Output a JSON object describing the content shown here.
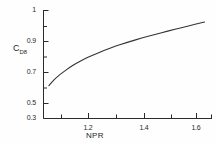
{
  "chart_data": {
    "type": "line",
    "title": "",
    "xlabel": "NPR",
    "ylabel": "C",
    "ylabel_subscript": "D8",
    "xlim": [
      1.03,
      1.72
    ],
    "ylim": [
      0.3,
      1.0
    ],
    "grid": false,
    "legend": null,
    "x_ticks_major": [
      1.2,
      1.4,
      1.6
    ],
    "x_tick_labels": [
      "1.2",
      "1.4",
      "1.6"
    ],
    "x_ticks_minor": [
      1.1,
      1.3,
      1.5,
      1.7
    ],
    "y_ticks_major": [
      0.3,
      0.5,
      0.7,
      0.9,
      1.0
    ],
    "y_tick_labels": [
      "0.3",
      "0.5",
      "0.7",
      "0.9",
      "1"
    ],
    "y_ticks_minor": [
      0.4,
      0.6,
      0.8,
      0.95
    ],
    "series": [
      {
        "name": "CD8 vs NPR",
        "x": [
          1.05,
          1.07,
          1.09,
          1.11,
          1.14,
          1.17,
          1.2,
          1.24,
          1.28,
          1.32,
          1.37,
          1.42,
          1.47,
          1.52,
          1.57,
          1.63
        ],
        "y": [
          0.513,
          0.552,
          0.583,
          0.609,
          0.645,
          0.675,
          0.7,
          0.73,
          0.757,
          0.781,
          0.808,
          0.833,
          0.856,
          0.878,
          0.9,
          0.925
        ]
      }
    ]
  },
  "axes": {
    "x_title": "NPR",
    "y_title_base": "C",
    "y_title_sub": "D8"
  },
  "labels": {
    "y": [
      "1",
      "0.9",
      "0.7",
      "0.5",
      "0.3"
    ],
    "x": [
      "1.2",
      "1.4",
      "1.6"
    ]
  },
  "colors": {
    "curve": "#333333",
    "axis": "#2b2b2b",
    "background": "#fefefe"
  }
}
